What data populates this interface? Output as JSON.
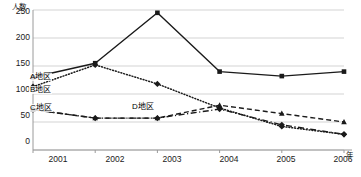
{
  "chart_data": {
    "type": "line",
    "title": "",
    "xlabel": "年",
    "ylabel": "人数",
    "categories": [
      "2001",
      "2002",
      "2003",
      "2004",
      "2005",
      "2006"
    ],
    "xlim": [
      2001,
      2006
    ],
    "ylim": [
      0,
      250
    ],
    "yticks": [
      0,
      50,
      100,
      150,
      200,
      250
    ],
    "grid": true,
    "legend_position": "inline-left",
    "series": [
      {
        "name": "A地区",
        "label": "A地区",
        "line_style": "solid",
        "marker": "square",
        "color": "#1a1a1a",
        "values": [
          130,
          155,
          245,
          140,
          132,
          140
        ]
      },
      {
        "name": "B地区",
        "label": "B地区",
        "line_style": "dotted",
        "marker": "diamond",
        "color": "#1a1a1a",
        "values": [
          113,
          152,
          118,
          75,
          42,
          28
        ]
      },
      {
        "name": "C地区",
        "label": "C地区",
        "line_style": "dashed",
        "marker": "triangle",
        "color": "#1a1a1a",
        "values": [
          72,
          57,
          57,
          80,
          65,
          50
        ]
      },
      {
        "name": "D地区",
        "label": "D地区",
        "line_style": "dashdot",
        "marker": "diamond",
        "color": "#1a1a1a",
        "values": [
          72,
          57,
          57,
          73,
          45,
          28
        ]
      }
    ]
  },
  "axes": {
    "y_title": "人数",
    "x_title": "年",
    "y_tick_labels": [
      "250",
      "200",
      "150",
      "100",
      "50",
      "0"
    ],
    "x_tick_labels": [
      "2001",
      "2002",
      "2003",
      "2004",
      "2005",
      "2006"
    ]
  },
  "labels": {
    "a": "A地区",
    "b": "B地区",
    "c": "C地区",
    "d": "D地区"
  },
  "colors": {
    "line": "#1a1a1a",
    "grid": "#c8c8c8",
    "axis": "#9a9a9a",
    "background": "#ffffff"
  }
}
